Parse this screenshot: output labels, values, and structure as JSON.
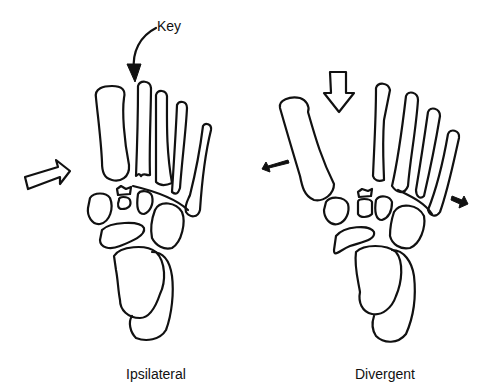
{
  "figure": {
    "panels": [
      {
        "id": "left",
        "caption": "Ipsilateral"
      },
      {
        "id": "right",
        "caption": "Divergent"
      }
    ],
    "annotations": {
      "key_label": "Key"
    }
  }
}
